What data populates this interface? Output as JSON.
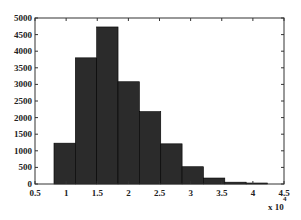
{
  "chart_data": {
    "type": "bar",
    "title": "",
    "xlabel": "",
    "ylabel": "",
    "x_multiplier_label": "x 10",
    "x_multiplier_exponent": "4",
    "bin_edges": [
      0.805,
      1.148,
      1.491,
      1.834,
      2.177,
      2.52,
      2.863,
      3.206,
      3.549,
      3.892,
      4.235
    ],
    "categories": [
      "0.98",
      "1.32",
      "1.66",
      "2.01",
      "2.35",
      "2.69",
      "3.03",
      "3.38",
      "3.72",
      "4.06"
    ],
    "values": [
      1230,
      3800,
      4730,
      3080,
      2180,
      1210,
      520,
      180,
      55,
      30
    ],
    "xlim": [
      0.5,
      4.5
    ],
    "ylim": [
      0,
      5000
    ],
    "xticks": [
      "0.5",
      "1",
      "1.5",
      "2",
      "2.5",
      "3",
      "3.5",
      "4",
      "4.5"
    ],
    "yticks": [
      "0",
      "500",
      "1000",
      "1500",
      "2000",
      "2500",
      "3000",
      "3500",
      "4000",
      "4500",
      "5000"
    ],
    "grid": false,
    "legend": null,
    "bar_color": "#2b2b2b",
    "edge_color": "#000000"
  }
}
